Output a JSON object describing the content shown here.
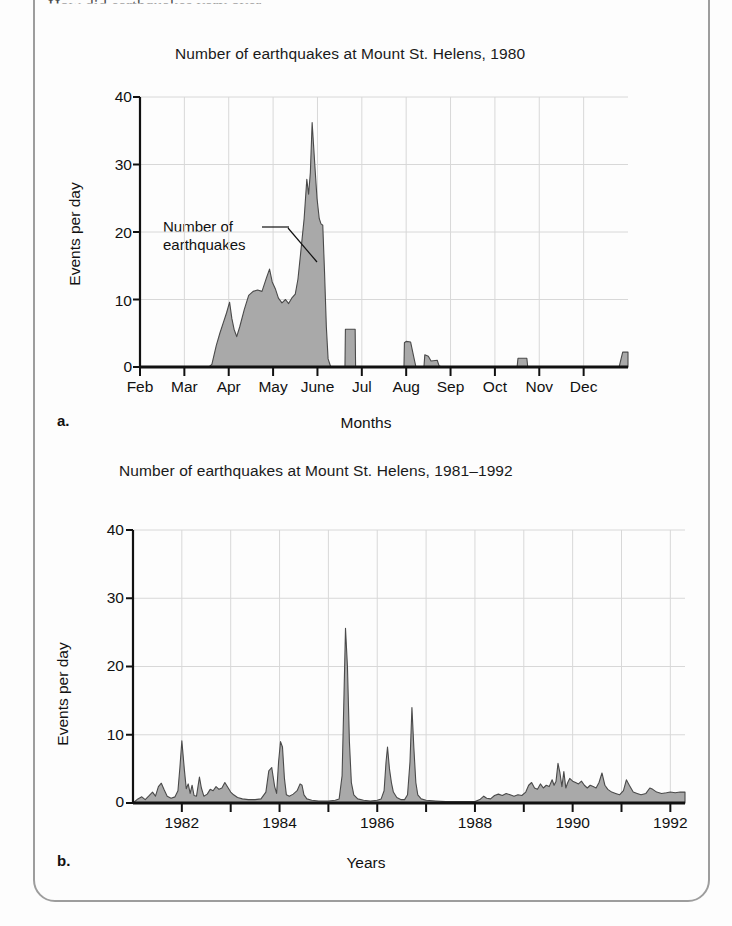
{
  "page": {
    "clipped_header_text": "How did earthquakes vary over",
    "frame_color": "#9d9d9d",
    "fill_color": "#a9a9a9",
    "line_color": "#4a4a4a",
    "grid_color": "#d8d8d8"
  },
  "panels": [
    {
      "letter": "a.",
      "title": "Number of earthquakes at Mount St. Helens, 1980",
      "ylabel": "Events per day",
      "xlabel": "Months",
      "annotation": [
        "Number of",
        "earthquakes"
      ]
    },
    {
      "letter": "b.",
      "title": "Number of earthquakes at Mount St. Helens, 1981–1992",
      "ylabel": "Events per day",
      "xlabel": "Years"
    }
  ],
  "chart_data": [
    {
      "type": "area",
      "title": "Number of earthquakes at Mount St. Helens, 1980",
      "xlabel": "Months",
      "ylabel": "Events per day",
      "ylim": [
        0,
        40
      ],
      "yticks": [
        0,
        10,
        20,
        30,
        40
      ],
      "ytick_labels": [
        "0",
        "10",
        "20",
        "30",
        "40"
      ],
      "xtick_labels": [
        "Feb",
        "Mar",
        "Apr",
        "May",
        "June",
        "Jul",
        "Aug",
        "Sep",
        "Oct",
        "Nov",
        "Dec"
      ],
      "grid": true,
      "annotation": "Number of earthquakes",
      "x_unit": "month_fraction_from_Feb",
      "xlim": [
        0,
        11
      ],
      "points": [
        [
          0.0,
          0.0
        ],
        [
          1.0,
          0.0
        ],
        [
          1.55,
          0.0
        ],
        [
          1.62,
          0.4
        ],
        [
          1.72,
          3.2
        ],
        [
          1.8,
          5.0
        ],
        [
          1.88,
          6.6
        ],
        [
          1.95,
          8.0
        ],
        [
          2.02,
          9.6
        ],
        [
          2.07,
          7.2
        ],
        [
          2.12,
          5.6
        ],
        [
          2.18,
          4.5
        ],
        [
          2.25,
          6.0
        ],
        [
          2.35,
          8.5
        ],
        [
          2.45,
          10.6
        ],
        [
          2.55,
          11.2
        ],
        [
          2.65,
          11.4
        ],
        [
          2.75,
          11.2
        ],
        [
          2.85,
          13.2
        ],
        [
          2.92,
          14.5
        ],
        [
          2.98,
          12.6
        ],
        [
          3.05,
          11.6
        ],
        [
          3.12,
          10.2
        ],
        [
          3.2,
          9.5
        ],
        [
          3.28,
          10.0
        ],
        [
          3.35,
          9.4
        ],
        [
          3.42,
          10.2
        ],
        [
          3.5,
          10.8
        ],
        [
          3.56,
          13.0
        ],
        [
          3.62,
          16.8
        ],
        [
          3.7,
          22.0
        ],
        [
          3.76,
          27.8
        ],
        [
          3.8,
          25.6
        ],
        [
          3.84,
          28.8
        ],
        [
          3.88,
          36.2
        ],
        [
          3.94,
          30.0
        ],
        [
          3.99,
          25.0
        ],
        [
          4.04,
          22.0
        ],
        [
          4.08,
          21.2
        ],
        [
          4.12,
          21.0
        ],
        [
          4.16,
          14.0
        ],
        [
          4.2,
          6.0
        ],
        [
          4.24,
          1.2
        ],
        [
          4.3,
          0.0
        ],
        [
          4.62,
          0.0
        ],
        [
          4.63,
          5.6
        ],
        [
          4.85,
          5.6
        ],
        [
          4.86,
          0.0
        ],
        [
          5.95,
          0.0
        ],
        [
          5.96,
          3.6
        ],
        [
          6.0,
          3.8
        ],
        [
          6.1,
          3.7
        ],
        [
          6.18,
          1.2
        ],
        [
          6.22,
          0.0
        ],
        [
          6.4,
          0.0
        ],
        [
          6.42,
          1.8
        ],
        [
          6.5,
          1.6
        ],
        [
          6.56,
          0.9
        ],
        [
          6.7,
          1.0
        ],
        [
          6.74,
          0.2
        ],
        [
          6.8,
          0.0
        ],
        [
          8.5,
          0.0
        ],
        [
          8.52,
          1.3
        ],
        [
          8.72,
          1.3
        ],
        [
          8.74,
          0.0
        ],
        [
          10.8,
          0.0
        ],
        [
          10.88,
          2.2
        ],
        [
          11.0,
          2.2
        ]
      ]
    },
    {
      "type": "area",
      "title": "Number of earthquakes at Mount St. Helens, 1981–1992",
      "xlabel": "Years",
      "ylabel": "Events per day",
      "ylim": [
        0,
        40
      ],
      "yticks": [
        0,
        10,
        20,
        30,
        40
      ],
      "ytick_labels": [
        "0",
        "10",
        "20",
        "30",
        "40"
      ],
      "xtick_labels": [
        "1982",
        "1984",
        "1986",
        "1988",
        "1990",
        "1992"
      ],
      "grid": true,
      "x_unit": "year",
      "xlim": [
        1981.0,
        1992.3
      ],
      "points": [
        [
          1981.0,
          0.0
        ],
        [
          1981.1,
          0.6
        ],
        [
          1981.18,
          0.9
        ],
        [
          1981.25,
          0.5
        ],
        [
          1981.32,
          1.0
        ],
        [
          1981.4,
          1.6
        ],
        [
          1981.46,
          1.0
        ],
        [
          1981.52,
          2.4
        ],
        [
          1981.58,
          2.9
        ],
        [
          1981.64,
          1.9
        ],
        [
          1981.7,
          1.0
        ],
        [
          1981.78,
          0.7
        ],
        [
          1981.86,
          0.9
        ],
        [
          1981.92,
          1.8
        ],
        [
          1981.96,
          5.2
        ],
        [
          1982.0,
          9.1
        ],
        [
          1982.05,
          5.0
        ],
        [
          1982.09,
          2.1
        ],
        [
          1982.13,
          2.8
        ],
        [
          1982.17,
          1.4
        ],
        [
          1982.21,
          2.6
        ],
        [
          1982.25,
          1.1
        ],
        [
          1982.3,
          1.0
        ],
        [
          1982.36,
          3.8
        ],
        [
          1982.4,
          2.2
        ],
        [
          1982.45,
          1.0
        ],
        [
          1982.52,
          1.3
        ],
        [
          1982.58,
          2.0
        ],
        [
          1982.64,
          1.8
        ],
        [
          1982.7,
          2.4
        ],
        [
          1982.76,
          2.0
        ],
        [
          1982.82,
          2.2
        ],
        [
          1982.88,
          3.0
        ],
        [
          1982.94,
          2.3
        ],
        [
          1983.0,
          1.6
        ],
        [
          1983.06,
          1.2
        ],
        [
          1983.14,
          0.8
        ],
        [
          1983.24,
          0.6
        ],
        [
          1983.36,
          0.5
        ],
        [
          1983.5,
          0.5
        ],
        [
          1983.62,
          0.6
        ],
        [
          1983.72,
          1.6
        ],
        [
          1983.78,
          4.7
        ],
        [
          1983.84,
          5.2
        ],
        [
          1983.9,
          2.4
        ],
        [
          1983.94,
          1.4
        ],
        [
          1983.98,
          6.0
        ],
        [
          1984.02,
          9.0
        ],
        [
          1984.06,
          8.2
        ],
        [
          1984.1,
          3.6
        ],
        [
          1984.14,
          1.2
        ],
        [
          1984.2,
          1.0
        ],
        [
          1984.28,
          1.3
        ],
        [
          1984.36,
          1.8
        ],
        [
          1984.42,
          2.8
        ],
        [
          1984.46,
          2.6
        ],
        [
          1984.5,
          1.2
        ],
        [
          1984.56,
          0.6
        ],
        [
          1984.66,
          0.4
        ],
        [
          1984.8,
          0.3
        ],
        [
          1985.0,
          0.3
        ],
        [
          1985.14,
          0.4
        ],
        [
          1985.22,
          0.6
        ],
        [
          1985.28,
          4.0
        ],
        [
          1985.32,
          16.0
        ],
        [
          1985.35,
          25.6
        ],
        [
          1985.39,
          20.0
        ],
        [
          1985.43,
          9.0
        ],
        [
          1985.47,
          3.0
        ],
        [
          1985.52,
          1.2
        ],
        [
          1985.6,
          0.6
        ],
        [
          1985.72,
          0.4
        ],
        [
          1985.86,
          0.3
        ],
        [
          1986.0,
          0.4
        ],
        [
          1986.08,
          0.6
        ],
        [
          1986.14,
          1.8
        ],
        [
          1986.18,
          6.0
        ],
        [
          1986.21,
          8.2
        ],
        [
          1986.25,
          5.0
        ],
        [
          1986.29,
          3.0
        ],
        [
          1986.33,
          1.6
        ],
        [
          1986.4,
          0.8
        ],
        [
          1986.48,
          0.5
        ],
        [
          1986.56,
          0.5
        ],
        [
          1986.62,
          1.2
        ],
        [
          1986.67,
          6.0
        ],
        [
          1986.71,
          14.0
        ],
        [
          1986.75,
          8.0
        ],
        [
          1986.79,
          3.0
        ],
        [
          1986.83,
          1.2
        ],
        [
          1986.9,
          0.6
        ],
        [
          1987.0,
          0.4
        ],
        [
          1987.2,
          0.3
        ],
        [
          1987.4,
          0.2
        ],
        [
          1987.6,
          0.2
        ],
        [
          1987.8,
          0.2
        ],
        [
          1988.0,
          0.2
        ],
        [
          1988.1,
          0.5
        ],
        [
          1988.18,
          1.0
        ],
        [
          1988.24,
          0.7
        ],
        [
          1988.32,
          0.6
        ],
        [
          1988.4,
          1.1
        ],
        [
          1988.48,
          1.3
        ],
        [
          1988.56,
          1.1
        ],
        [
          1988.64,
          1.4
        ],
        [
          1988.72,
          1.2
        ],
        [
          1988.8,
          1.0
        ],
        [
          1988.88,
          1.2
        ],
        [
          1988.96,
          1.1
        ],
        [
          1989.04,
          1.6
        ],
        [
          1989.1,
          2.6
        ],
        [
          1989.16,
          3.0
        ],
        [
          1989.22,
          2.2
        ],
        [
          1989.28,
          2.0
        ],
        [
          1989.34,
          2.8
        ],
        [
          1989.4,
          2.2
        ],
        [
          1989.46,
          2.6
        ],
        [
          1989.52,
          2.4
        ],
        [
          1989.58,
          3.4
        ],
        [
          1989.62,
          2.6
        ],
        [
          1989.66,
          3.2
        ],
        [
          1989.7,
          5.8
        ],
        [
          1989.74,
          4.4
        ],
        [
          1989.78,
          2.4
        ],
        [
          1989.82,
          4.6
        ],
        [
          1989.86,
          2.2
        ],
        [
          1989.9,
          3.0
        ],
        [
          1989.94,
          3.6
        ],
        [
          1990.0,
          3.2
        ],
        [
          1990.06,
          3.0
        ],
        [
          1990.12,
          2.8
        ],
        [
          1990.18,
          3.2
        ],
        [
          1990.24,
          2.6
        ],
        [
          1990.3,
          2.2
        ],
        [
          1990.36,
          2.6
        ],
        [
          1990.42,
          2.4
        ],
        [
          1990.48,
          2.2
        ],
        [
          1990.54,
          3.0
        ],
        [
          1990.6,
          4.4
        ],
        [
          1990.66,
          2.6
        ],
        [
          1990.72,
          2.0
        ],
        [
          1990.8,
          1.6
        ],
        [
          1990.88,
          1.4
        ],
        [
          1990.96,
          1.2
        ],
        [
          1991.04,
          1.8
        ],
        [
          1991.1,
          3.4
        ],
        [
          1991.16,
          2.6
        ],
        [
          1991.24,
          1.6
        ],
        [
          1991.32,
          1.4
        ],
        [
          1991.4,
          1.2
        ],
        [
          1991.5,
          1.4
        ],
        [
          1991.58,
          2.2
        ],
        [
          1991.64,
          2.0
        ],
        [
          1991.72,
          1.6
        ],
        [
          1991.82,
          1.4
        ],
        [
          1991.92,
          1.5
        ],
        [
          1992.0,
          1.6
        ],
        [
          1992.1,
          1.5
        ],
        [
          1992.2,
          1.6
        ],
        [
          1992.3,
          1.6
        ]
      ]
    }
  ]
}
